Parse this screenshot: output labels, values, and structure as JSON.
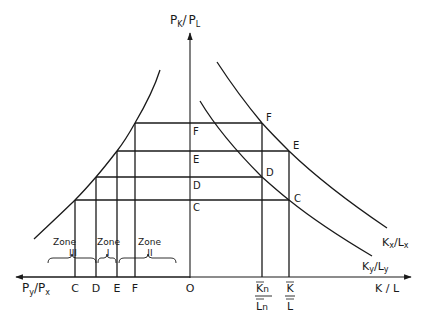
{
  "diagram": {
    "type": "economic-diagram",
    "vertical_axis": {
      "label_main": "P",
      "label_sub1": "K",
      "slash": "/",
      "label_main2": "P",
      "label_sub2": "L"
    },
    "horizontal_axis_left": {
      "label_main": "P",
      "label_sub1": "y",
      "slash": "/",
      "label_main2": "P",
      "label_sub2": "x"
    },
    "horizontal_axis_right": {
      "label": "K / L"
    },
    "origin": "O",
    "price_levels": [
      "F",
      "E",
      "D",
      "C"
    ],
    "left_ticks": [
      "C",
      "D",
      "E",
      "F"
    ],
    "right_ticks": {
      "kn_ln": {
        "num": "K",
        "num_sub": "n",
        "den": "L",
        "den_sub": "n"
      },
      "k_l": {
        "num": "K",
        "den": "L"
      }
    },
    "curves": {
      "kx_lx": {
        "main": "K",
        "sub1": "x",
        "slash": "/",
        "main2": "L",
        "sub2": "x"
      },
      "ky_ly": {
        "main": "K",
        "sub1": "y",
        "slash": "/",
        "main2": "L",
        "sub2": "y"
      }
    },
    "curve_points": {
      "kx_lx_upper": [
        "F",
        "E"
      ],
      "ky_ly_lower": [
        "D",
        "C"
      ]
    },
    "zones": [
      {
        "word": "Zone",
        "numeral": "III"
      },
      {
        "word": "Zone",
        "numeral": "I"
      },
      {
        "word": "Zone",
        "numeral": "II"
      }
    ]
  }
}
